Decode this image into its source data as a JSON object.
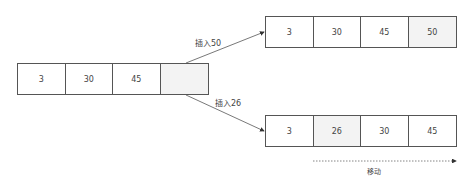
{
  "diagram": {
    "source_array": {
      "cells": [
        "3",
        "30",
        "45",
        ""
      ],
      "shaded_index": 3
    },
    "insert_50": {
      "label": "插入50",
      "result_array": {
        "cells": [
          "3",
          "30",
          "45",
          "50"
        ],
        "shaded_index": 3
      }
    },
    "insert_26": {
      "label": "插入26",
      "result_array": {
        "cells": [
          "3",
          "26",
          "30",
          "45"
        ],
        "shaded_index": 1
      }
    },
    "shift_arrow": {
      "label": "移动"
    },
    "colors": {
      "border": "#555555",
      "shaded_cell": "#f3f3f3",
      "text": "#444444"
    }
  }
}
